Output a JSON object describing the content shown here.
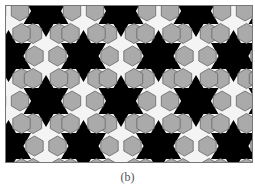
{
  "figure": {
    "caption": "(b)",
    "colors": {
      "star": "#000000",
      "hexagon": "#aaaaaa",
      "hexagon_stroke": "#666666",
      "background_tile": "#f4f4f4",
      "frame": "#777777"
    },
    "tiling": {
      "star_spacing_x": 75,
      "star_spacing_y": 45,
      "row_offset_x": 37.5,
      "star_radius": 26,
      "hex_radius": 10
    }
  }
}
